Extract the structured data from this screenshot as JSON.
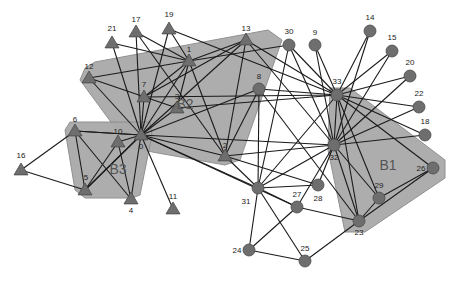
{
  "diagram": {
    "type": "network-graph",
    "regions": [
      {
        "id": "B1",
        "label": "B1",
        "label_pos": [
          388,
          170
        ],
        "points": "330,88 350,88 445,160 445,178 365,232 345,232 328,150"
      },
      {
        "id": "B2",
        "label": "B2",
        "label_pos": [
          185,
          109
        ],
        "points": "85,68 95,62 268,30 282,40 240,160 225,165 130,148 80,80"
      },
      {
        "id": "B3",
        "label": "B3",
        "label_pos": [
          118,
          174
        ],
        "points": "70,122 150,122 152,135 140,195 132,198 85,198 75,190 65,130"
      }
    ],
    "nodes": [
      {
        "id": "0",
        "shape": "triangle",
        "x": 141,
        "y": 135,
        "label_dx": 0,
        "label_dy": 14
      },
      {
        "id": "1",
        "shape": "triangle",
        "x": 189,
        "y": 61,
        "label_dx": 0,
        "label_dy": -9
      },
      {
        "id": "2",
        "shape": "triangle",
        "x": 225,
        "y": 156,
        "label_dx": 0,
        "label_dy": -8
      },
      {
        "id": "3",
        "shape": "triangle",
        "x": 177,
        "y": 108,
        "label_dx": 0,
        "label_dy": -9
      },
      {
        "id": "4",
        "shape": "triangle",
        "x": 131,
        "y": 199,
        "label_dx": 0,
        "label_dy": 14
      },
      {
        "id": "5",
        "shape": "triangle",
        "x": 85,
        "y": 190,
        "label_dx": 1,
        "label_dy": -10
      },
      {
        "id": "6",
        "shape": "triangle",
        "x": 75,
        "y": 131,
        "label_dx": 0,
        "label_dy": -9
      },
      {
        "id": "7",
        "shape": "triangle",
        "x": 144,
        "y": 97,
        "label_dx": 0,
        "label_dy": -10
      },
      {
        "id": "8",
        "shape": "circle",
        "x": 259,
        "y": 89,
        "label_dx": 0,
        "label_dy": -10
      },
      {
        "id": "9",
        "shape": "circle",
        "x": 315,
        "y": 45,
        "label_dx": 0,
        "label_dy": -10
      },
      {
        "id": "10",
        "shape": "triangle",
        "x": 118,
        "y": 142,
        "label_dx": 0,
        "label_dy": -8
      },
      {
        "id": "11",
        "shape": "triangle",
        "x": 173,
        "y": 209,
        "label_dx": 0,
        "label_dy": -10
      },
      {
        "id": "12",
        "shape": "triangle",
        "x": 89,
        "y": 78,
        "label_dx": 0,
        "label_dy": -9
      },
      {
        "id": "13",
        "shape": "triangle",
        "x": 246,
        "y": 40,
        "label_dx": 0,
        "label_dy": -9
      },
      {
        "id": "14",
        "shape": "circle",
        "x": 370,
        "y": 31,
        "label_dx": 0,
        "label_dy": -11
      },
      {
        "id": "15",
        "shape": "circle",
        "x": 392,
        "y": 51,
        "label_dx": 0,
        "label_dy": -11
      },
      {
        "id": "16",
        "shape": "triangle",
        "x": 21,
        "y": 170,
        "label_dx": 0,
        "label_dy": -12
      },
      {
        "id": "17",
        "shape": "triangle",
        "x": 136,
        "y": 32,
        "label_dx": 0,
        "label_dy": -10
      },
      {
        "id": "18",
        "shape": "circle",
        "x": 425,
        "y": 135,
        "label_dx": 0,
        "label_dy": -11
      },
      {
        "id": "19",
        "shape": "triangle",
        "x": 169,
        "y": 29,
        "label_dx": 0,
        "label_dy": -12
      },
      {
        "id": "20",
        "shape": "circle",
        "x": 410,
        "y": 76,
        "label_dx": 0,
        "label_dy": -11
      },
      {
        "id": "21",
        "shape": "triangle",
        "x": 112,
        "y": 43,
        "label_dx": 0,
        "label_dy": -12
      },
      {
        "id": "22",
        "shape": "circle",
        "x": 419,
        "y": 107,
        "label_dx": 0,
        "label_dy": -11
      },
      {
        "id": "23",
        "shape": "circle",
        "x": 359,
        "y": 221,
        "label_dx": 0,
        "label_dy": 14
      },
      {
        "id": "24",
        "shape": "circle",
        "x": 249,
        "y": 250,
        "label_dx": -12,
        "label_dy": 3
      },
      {
        "id": "25",
        "shape": "circle",
        "x": 305,
        "y": 261,
        "label_dx": 0,
        "label_dy": -10
      },
      {
        "id": "26",
        "shape": "circle",
        "x": 433,
        "y": 168,
        "label_dx": -12,
        "label_dy": 3
      },
      {
        "id": "27",
        "shape": "circle",
        "x": 297,
        "y": 207,
        "label_dx": 0,
        "label_dy": -10
      },
      {
        "id": "28",
        "shape": "circle",
        "x": 318,
        "y": 185,
        "label_dx": 0,
        "label_dy": 16
      },
      {
        "id": "29",
        "shape": "circle",
        "x": 379,
        "y": 198,
        "label_dx": 0,
        "label_dy": -10
      },
      {
        "id": "30",
        "shape": "circle",
        "x": 289,
        "y": 45,
        "label_dx": 0,
        "label_dy": -11
      },
      {
        "id": "31",
        "shape": "circle",
        "x": 258,
        "y": 188,
        "label_dx": -12,
        "label_dy": 16
      },
      {
        "id": "32",
        "shape": "circle",
        "x": 334,
        "y": 145,
        "label_dx": 0,
        "label_dy": 15
      },
      {
        "id": "33",
        "shape": "circle",
        "x": 337,
        "y": 95,
        "label_dx": 0,
        "label_dy": -11
      }
    ],
    "edges": [
      [
        "0",
        "1"
      ],
      [
        "0",
        "2"
      ],
      [
        "0",
        "3"
      ],
      [
        "0",
        "4"
      ],
      [
        "0",
        "5"
      ],
      [
        "0",
        "6"
      ],
      [
        "0",
        "7"
      ],
      [
        "0",
        "10"
      ],
      [
        "0",
        "11"
      ],
      [
        "0",
        "12"
      ],
      [
        "0",
        "13"
      ],
      [
        "0",
        "17"
      ],
      [
        "0",
        "19"
      ],
      [
        "0",
        "21"
      ],
      [
        "0",
        "8"
      ],
      [
        "0",
        "31"
      ],
      [
        "0",
        "32"
      ],
      [
        "0",
        "27"
      ],
      [
        "1",
        "21"
      ],
      [
        "1",
        "7"
      ],
      [
        "1",
        "3"
      ],
      [
        "1",
        "2"
      ],
      [
        "1",
        "13"
      ],
      [
        "1",
        "17"
      ],
      [
        "1",
        "19"
      ],
      [
        "1",
        "30"
      ],
      [
        "1",
        "12"
      ],
      [
        "19",
        "33"
      ],
      [
        "17",
        "2"
      ],
      [
        "12",
        "3"
      ],
      [
        "7",
        "33"
      ],
      [
        "3",
        "33"
      ],
      [
        "7",
        "13"
      ],
      [
        "13",
        "2"
      ],
      [
        "13",
        "33"
      ],
      [
        "13",
        "32"
      ],
      [
        "2",
        "8"
      ],
      [
        "2",
        "32"
      ],
      [
        "2",
        "28"
      ],
      [
        "2",
        "31"
      ],
      [
        "6",
        "16"
      ],
      [
        "16",
        "5"
      ],
      [
        "6",
        "5"
      ],
      [
        "6",
        "4"
      ],
      [
        "6",
        "0"
      ],
      [
        "10",
        "5"
      ],
      [
        "10",
        "4"
      ],
      [
        "5",
        "0"
      ],
      [
        "8",
        "33"
      ],
      [
        "8",
        "23"
      ],
      [
        "30",
        "33"
      ],
      [
        "30",
        "32"
      ],
      [
        "30",
        "31"
      ],
      [
        "9",
        "33"
      ],
      [
        "9",
        "32"
      ],
      [
        "8",
        "31"
      ],
      [
        "33",
        "14"
      ],
      [
        "33",
        "15"
      ],
      [
        "33",
        "20"
      ],
      [
        "33",
        "22"
      ],
      [
        "33",
        "18"
      ],
      [
        "33",
        "32"
      ],
      [
        "33",
        "23"
      ],
      [
        "33",
        "29"
      ],
      [
        "33",
        "31"
      ],
      [
        "33",
        "26"
      ],
      [
        "32",
        "14"
      ],
      [
        "32",
        "15"
      ],
      [
        "32",
        "20"
      ],
      [
        "32",
        "22"
      ],
      [
        "32",
        "18"
      ],
      [
        "32",
        "23"
      ],
      [
        "32",
        "29"
      ],
      [
        "32",
        "28"
      ],
      [
        "32",
        "27"
      ],
      [
        "32",
        "31"
      ],
      [
        "31",
        "28"
      ],
      [
        "31",
        "24"
      ],
      [
        "31",
        "25"
      ],
      [
        "31",
        "27"
      ],
      [
        "27",
        "24"
      ],
      [
        "27",
        "23"
      ],
      [
        "24",
        "25"
      ],
      [
        "25",
        "23"
      ],
      [
        "23",
        "29"
      ],
      [
        "29",
        "26"
      ],
      [
        "23",
        "26"
      ]
    ]
  }
}
